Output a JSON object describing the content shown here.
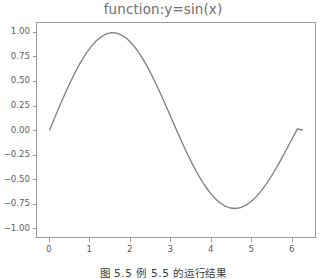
{
  "figure": {
    "caption": "图 5.5  例 5.5 的运行结果",
    "background_color": "#ffffff",
    "axes_color": "#9a9a9a",
    "tick_label_color": "#5d5d5d",
    "title_color": "#6e6e6e"
  },
  "chart_data": {
    "type": "line",
    "title": "function:y=sin(x)",
    "xlabel": "",
    "ylabel": "",
    "xlim": [
      -0.3142,
      6.5973
    ],
    "ylim": [
      -1.1,
      1.1
    ],
    "grid": false,
    "legend": null,
    "line_color": "#7f7f7f",
    "line_width": 1.3,
    "xticks": [
      0,
      1,
      2,
      3,
      4,
      5,
      6
    ],
    "xtick_labels": [
      "0",
      "1",
      "2",
      "3",
      "4",
      "5",
      "6"
    ],
    "yticks": [
      1.0,
      0.75,
      0.5,
      0.25,
      0.0,
      -0.25,
      -0.5,
      -0.75,
      -1.0
    ],
    "ytick_labels": [
      "1.00",
      "0.75",
      "0.50",
      "0.25",
      "0.00",
      "−0.25",
      "−0.50",
      "−0.75",
      "−1.00"
    ],
    "series": [
      {
        "name": "y=sin(x)",
        "x": [
          0.0,
          0.1283,
          0.2566,
          0.3848,
          0.5131,
          0.6414,
          0.7697,
          0.898,
          1.0263,
          1.1545,
          1.2828,
          1.4111,
          1.5394,
          1.6677,
          1.796,
          1.9242,
          2.0525,
          2.1808,
          2.3091,
          2.4374,
          2.5657,
          2.6939,
          2.8222,
          2.9505,
          3.0788,
          3.2071,
          3.3354,
          3.4636,
          3.5919,
          3.7202,
          3.8485,
          3.9768,
          4.1051,
          4.2333,
          4.3616,
          4.4899,
          4.6182,
          4.7465,
          4.8748,
          5.003,
          5.1313,
          5.2596,
          5.3879,
          5.5162,
          5.6445,
          5.7727,
          5.901,
          6.0293,
          6.1576,
          6.2832
        ],
        "y": [
          0.0,
          0.128,
          0.2538,
          0.3754,
          0.4907,
          0.5981,
          0.6957,
          0.7818,
          0.8551,
          0.9145,
          0.9589,
          0.9877,
          1.0,
          0.9956,
          0.9746,
          0.9374,
          0.8847,
          0.8172,
          0.7363,
          0.6435,
          0.5406,
          0.4297,
          0.3129,
          0.1924,
          0.0706,
          -0.0501,
          -0.1674,
          -0.2794,
          -0.3842,
          -0.48,
          -0.5654,
          -0.6393,
          -0.7005,
          -0.7484,
          -0.7824,
          -0.802,
          -0.8071,
          -0.7979,
          -0.7746,
          -0.7377,
          -0.6879,
          -0.6264,
          -0.5542,
          -0.4728,
          -0.3838,
          -0.289,
          -0.1901,
          -0.0892,
          0.0118,
          0.0
        ]
      }
    ]
  }
}
